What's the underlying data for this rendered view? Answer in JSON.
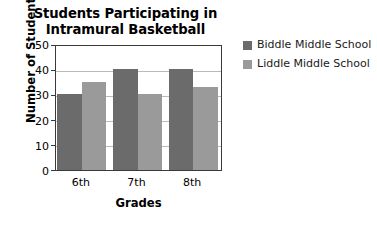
{
  "chart_data": {
    "type": "bar",
    "title": "Students Participating in Intramural Basketball",
    "title_lines": [
      "Students Participating in",
      "Intramural Basketball"
    ],
    "xlabel": "Grades",
    "ylabel": "Number of Students",
    "categories": [
      "6th",
      "7th",
      "8th"
    ],
    "series": [
      {
        "name": "Biddle Middle School",
        "color": "#6b6b6b",
        "values": [
          30,
          40,
          40
        ]
      },
      {
        "name": "Liddle Middle School",
        "color": "#9a9a9a",
        "values": [
          35,
          30,
          33
        ]
      }
    ],
    "ylim": [
      0,
      50
    ],
    "ytick_values": [
      0,
      10,
      20,
      30,
      40,
      50
    ],
    "ytick_labels": [
      "0",
      "10",
      "20",
      "30",
      "40",
      "50"
    ],
    "grid": true,
    "grid_axis": "y",
    "legend_position": "right",
    "background_color": "#ffffff",
    "axis_color": "#3a3a3a",
    "grid_color": "#b9b9b9"
  },
  "legend": {
    "entries": [
      {
        "label": "Biddle Middle School"
      },
      {
        "label": "Liddle Middle School"
      }
    ]
  }
}
